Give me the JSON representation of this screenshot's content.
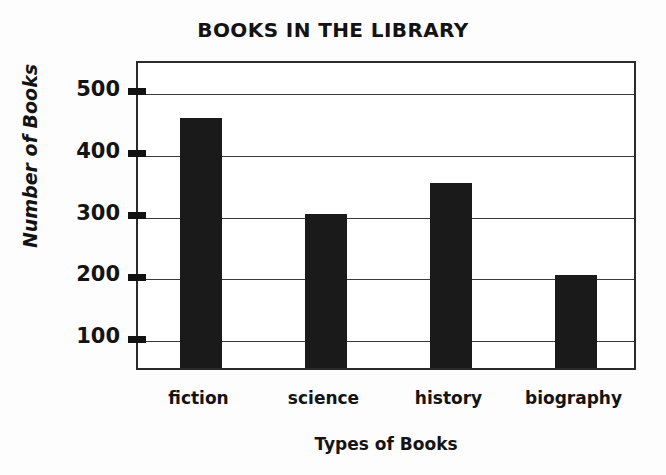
{
  "chart_data": {
    "type": "bar",
    "title": "BOOKS IN THE LIBRARY",
    "xlabel": "Types of Books",
    "ylabel": "Number of Books",
    "categories": [
      "fiction",
      "science",
      "history",
      "biography"
    ],
    "values": [
      455,
      300,
      350,
      200
    ],
    "ytick_labels": [
      "100",
      "200",
      "300",
      "400",
      "500"
    ],
    "ytick_values": [
      100,
      200,
      300,
      400,
      500
    ],
    "ylim": [
      50,
      550
    ],
    "xlim_note": "categorical",
    "grid": "horizontal",
    "legend": "none",
    "bar_color": "#1a1a1a",
    "axis_color": "#2b2b2b",
    "gridline_color": "#3a3a3a",
    "background_color": "#fdfdfd",
    "plot_background_color": "#ffffff"
  }
}
